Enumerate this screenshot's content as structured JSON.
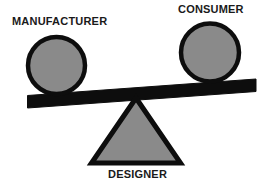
{
  "diagram": {
    "type": "balance-scale-seesaw",
    "background_color": "#ffffff",
    "stroke_color": "#0d0d0d",
    "fill_color": "#8a8a8a",
    "text_color": "#1a1a1a",
    "labels": {
      "left": "MANUFACTURER",
      "right": "CONSUMER",
      "fulcrum": "DESIGNER"
    },
    "elements": {
      "left_weight": "gray-circle",
      "right_weight": "gray-circle",
      "beam": "tilted-black-bar",
      "fulcrum": "gray-triangle"
    }
  }
}
